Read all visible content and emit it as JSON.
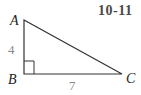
{
  "problem_number": "10-11",
  "triangle": {
    "vertices": {
      "A": "A",
      "B": "B",
      "C": "C"
    },
    "sides": {
      "AB": "4",
      "BC": "7"
    },
    "right_angle_at": "B",
    "line_color": "#333333",
    "label_color": "#888888"
  }
}
